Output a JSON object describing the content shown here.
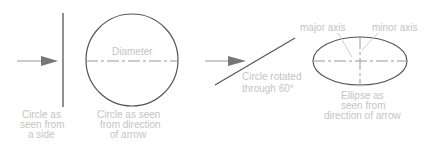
{
  "diagram": {
    "colors": {
      "line": "#555555",
      "label": "#c4c4c4",
      "arrow": "#777777",
      "dash": "#888888"
    },
    "panel_side": {
      "label_lines": [
        "Circle as",
        "seen from",
        "a side"
      ]
    },
    "panel_front": {
      "diameter_label": "Diameter",
      "label_lines": [
        "Circle as seen",
        "from direction",
        "of arrow"
      ]
    },
    "panel_rotated": {
      "label_lines": [
        "Circle rotated",
        "through 60°"
      ]
    },
    "panel_ellipse": {
      "major_axis_label": "major axis",
      "minor_axis_label": "minor axis",
      "label_lines": [
        "Ellipse as",
        "seen from",
        "direction of arrow"
      ]
    }
  }
}
